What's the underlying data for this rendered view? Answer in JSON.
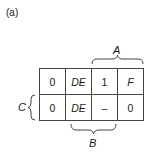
{
  "figure": {
    "label": "(a)"
  },
  "kmap": {
    "rows": [
      [
        {
          "value": "0",
          "italic": false
        },
        {
          "value": "DE",
          "italic": true
        },
        {
          "value": "1",
          "italic": false
        },
        {
          "value": "F",
          "italic": true
        }
      ],
      [
        {
          "value": "0",
          "italic": false
        },
        {
          "value": "DE",
          "italic": true
        },
        {
          "value": "–",
          "italic": false
        },
        {
          "value": "0",
          "italic": false
        }
      ]
    ]
  },
  "braces": {
    "A": {
      "label": "A",
      "position": "top",
      "spans_columns": [
        3,
        4
      ]
    },
    "B": {
      "label": "B",
      "position": "bottom",
      "spans_columns": [
        2,
        3
      ]
    },
    "C": {
      "label": "C",
      "position": "left",
      "spans_rows": [
        2
      ]
    }
  },
  "colors": {
    "line": "#444444",
    "text": "#1a1a1a",
    "background": "#ffffff"
  }
}
